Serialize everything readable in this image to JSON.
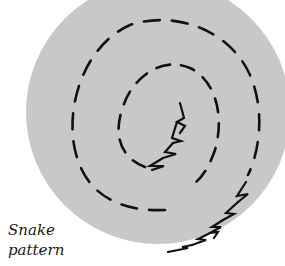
{
  "caption": {
    "line1": "Snake",
    "line2": "pattern"
  },
  "colors": {
    "background": "#ffffff",
    "fabric": "#c8c8c8",
    "stitch": "#111111",
    "caption": "#1a1a1a"
  },
  "diagram": {
    "hoop_circle": {
      "cx": 158,
      "cy": 112,
      "r": 132
    },
    "spiral_paths": [
      "outer-dashed-ring",
      "inner-dashed-ring"
    ],
    "whip_segments": [
      "inner-zigzag",
      "outer-zigzag"
    ]
  }
}
